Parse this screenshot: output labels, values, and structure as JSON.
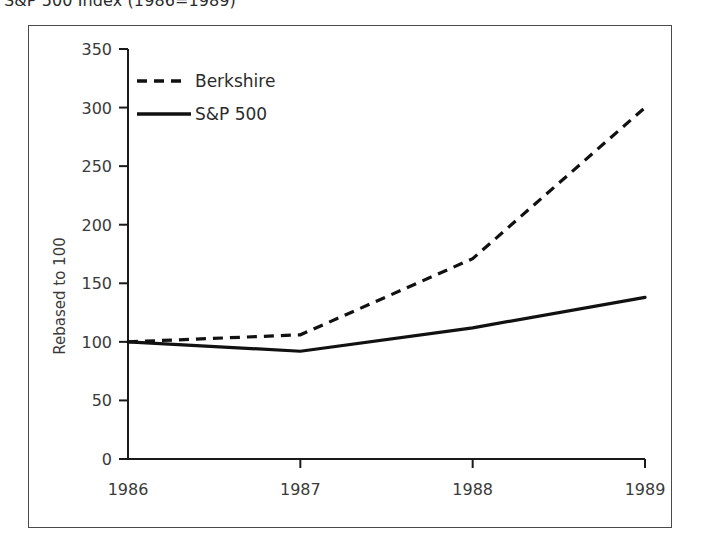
{
  "caption": {
    "text": "S&P 500 Index (1986=1989)"
  },
  "chart_data": {
    "type": "line",
    "title": "",
    "xlabel": "",
    "ylabel": "Rebased to 100",
    "x": [
      "1986",
      "1987",
      "1988",
      "1989"
    ],
    "categories": [
      "1986",
      "1987",
      "1988",
      "1989"
    ],
    "xlim": [
      1986,
      1989
    ],
    "ylim": [
      0,
      350
    ],
    "yticks": [
      0,
      50,
      100,
      150,
      200,
      250,
      300,
      350
    ],
    "ytick_labels": [
      "0",
      "50",
      "100",
      "150",
      "200",
      "250",
      "300",
      "350"
    ],
    "xtick_labels": [
      "1986",
      "1987",
      "1988",
      "1989"
    ],
    "grid": false,
    "legend_position": "top-left",
    "series": [
      {
        "name": "Berkshire",
        "style": "dashed",
        "color": "#111111",
        "values": [
          100,
          106,
          171,
          300
        ]
      },
      {
        "name": "S&P 500",
        "style": "solid",
        "color": "#111111",
        "values": [
          100,
          92,
          112,
          138
        ]
      }
    ]
  },
  "legend": {
    "items": [
      {
        "label": "Berkshire",
        "style": "dashed"
      },
      {
        "label": "S&P 500",
        "style": "solid"
      }
    ]
  },
  "colors": {
    "ink": "#111111",
    "frame": "#4a4a4a",
    "background": "#ffffff"
  }
}
